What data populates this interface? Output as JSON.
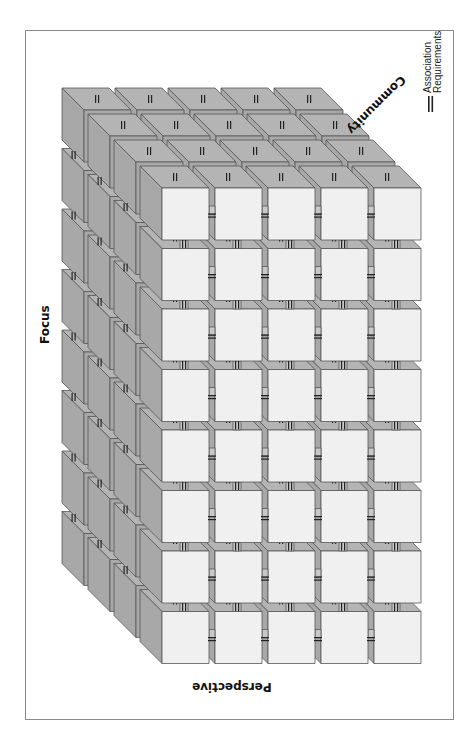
{
  "figure": {
    "caption": "Figure 14 Block Requirements Grid Framework",
    "axes": {
      "focus": "Focus",
      "perspective": "Perspective",
      "community": "Community"
    },
    "legend": {
      "line1": "Association",
      "line2": "Requirements",
      "symbol": "double-bar"
    }
  },
  "grid": {
    "columns": 5,
    "rows": 8,
    "layers": 4,
    "front_origin": [
      162,
      188
    ],
    "cell_width": 47,
    "cell_height": 52,
    "pitch_x": 53,
    "pitch_y": 60.5,
    "depth_step": [
      -26,
      -26
    ],
    "depth_size": 22
  },
  "colors": {
    "front_face": "#f0f0f0",
    "top_face": "#b4b4b4",
    "side_face": "#a8a8a8",
    "edge": "#555555",
    "connector": "#c8c8c8",
    "connector_light": "#ffffff",
    "association_bar": "#222222",
    "frame": "#8a8a8a"
  }
}
